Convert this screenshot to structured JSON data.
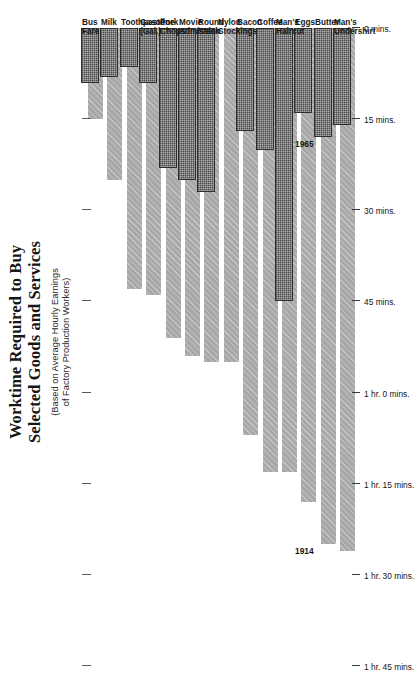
{
  "chart_data": {
    "type": "bar",
    "orientation": "horizontal",
    "title": "Worktime Required to Buy Selected Goods and Services",
    "title_lines": [
      "Worktime Required to Buy",
      "Selected Goods and Services"
    ],
    "subtitle": "(Based on Average Hourly Earnings of Factory Production Workers)",
    "subtitle_lines": [
      "(Based on Average Hourly Earnings",
      "of Factory Production Workers)"
    ],
    "xlabel": "",
    "ylabel": "",
    "value_unit": "minutes of worktime",
    "xlim": [
      0,
      105
    ],
    "axis_reversed": true,
    "grid": false,
    "legend_position": "inline-annotation",
    "axis_ticks": [
      105,
      90,
      75,
      60,
      45,
      30,
      15,
      0
    ],
    "tick_labels": [
      "1 hr. 45 mins.",
      "1 hr. 30 mins.",
      "1 hr. 15 mins.",
      "1 hr. 0 mins.",
      "45 mins.",
      "30 mins.",
      "15 mins.",
      "0 mins."
    ],
    "categories": [
      "Bus Fare",
      "Milk",
      "Toothpaste",
      "Gasoline (Gal.)",
      "Pork Chops",
      "Movie Admission",
      "Round Steak",
      "Nylon Stockings",
      "Bacon",
      "Coffee",
      "Man's Haircut",
      "Eggs",
      "Butter",
      "Man's Undershirt"
    ],
    "category_label_lines": [
      [
        "Bus Fare"
      ],
      [
        "Milk"
      ],
      [
        "Toothpaste"
      ],
      [
        "Gasoline",
        "(Gal.)"
      ],
      [
        "Pork",
        "Chops"
      ],
      [
        "Movie",
        "Admission"
      ],
      [
        "Round",
        "Steak"
      ],
      [
        "Nylon",
        "Stockings"
      ],
      [
        "Bacon"
      ],
      [
        "Coffee"
      ],
      [
        "Man's",
        "Haircut"
      ],
      [
        "Eggs"
      ],
      [
        "Butter"
      ],
      [
        "Man's",
        "Undershirt"
      ]
    ],
    "series": [
      {
        "name": "1914",
        "color": "#a8a8a8",
        "values": [
          15,
          25,
          43,
          44,
          51,
          54,
          55,
          55,
          67,
          73,
          73,
          78,
          85,
          86
        ]
      },
      {
        "name": "1965",
        "color": "#4a4a4a",
        "values": [
          9,
          8,
          6.5,
          9,
          23,
          25,
          27,
          0,
          17,
          20,
          45,
          14,
          18,
          16
        ]
      }
    ],
    "annotations": [
      {
        "text": "1914",
        "series": "1914",
        "category": "Butter"
      },
      {
        "text": "1965",
        "series": "1965",
        "category": "Butter"
      }
    ]
  },
  "colors": {
    "background": "#ffffff",
    "ink": "#1c1c1c",
    "series_1914": "#a8a8a8",
    "series_1965": "#4a4a4a",
    "axis": "#3a3a3a"
  }
}
